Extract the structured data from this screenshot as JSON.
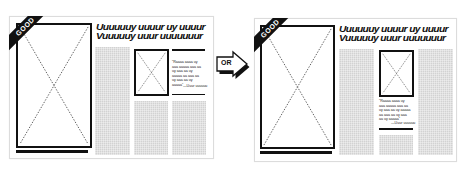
{
  "badge": {
    "left": "GOOD",
    "right": "GOOD"
  },
  "headline": {
    "line1": "Uuuuuuy uuuur uy uuuur",
    "line2": "Vuuuuuy uuur uuuuuuur"
  },
  "quote": {
    "text": "“Raaaa aaaa uy aaa aaaaa aaa aa uy aaa aa uy aaaaa aa aaa aa uy aaa aa uy aaaaa”",
    "attribution": "—Uuur uuuuuu"
  },
  "arrow": {
    "label": "OR"
  },
  "colors": {
    "ink": "#111111",
    "placeholder_gray": "#d2d2d2",
    "frame_border": "#dcdcdc"
  },
  "icons": {
    "image_placeholder": "x-box-image-placeholder-icon",
    "arrow": "right-arrow-icon"
  }
}
